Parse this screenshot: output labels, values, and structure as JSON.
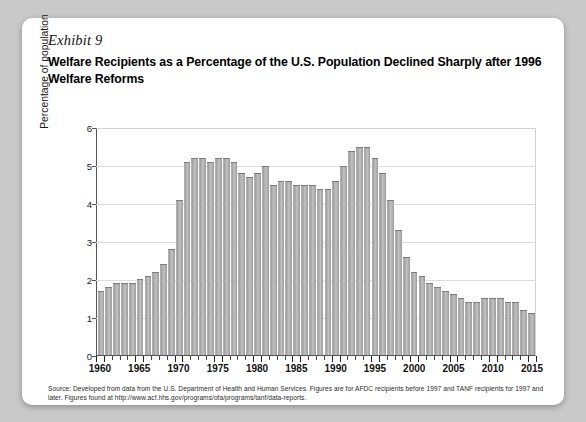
{
  "exhibit": {
    "label": "Exhibit 9"
  },
  "title": "Welfare Recipients as a Percentage of the U.S. Population Declined Sharply after 1996 Welfare Reforms",
  "source_note": "Source: Developed from data from the U.S. Department of Health and Human Services. Figures are for AFDC recipients before 1997 and TANF recipients for 1997 and later. Figures found at http://www.acf.hhs.gov/programs/ofa/programs/tanf/data-reports.",
  "colors": {
    "bar_fill": "#b0b0b0",
    "bar_edge": "#7d7d7d",
    "gridline": "#dcdcdc",
    "axis": "#555555",
    "card_background": "#ffffff",
    "page_background": "#c9c9c9"
  },
  "chart_data": {
    "type": "bar",
    "title": "Welfare Recipients as a Percentage of the U.S. Population Declined Sharply after 1996 Welfare Reforms",
    "xlabel": "",
    "ylabel": "Percentage of population",
    "ylim": [
      0,
      6
    ],
    "yticks": [
      0,
      1,
      2,
      3,
      4,
      5,
      6
    ],
    "ytick_labels": [
      "0",
      "1",
      "2",
      "3",
      "4",
      "5",
      "6"
    ],
    "xtick_labels": [
      "1960",
      "1965",
      "1970",
      "1975",
      "1980",
      "1985",
      "1990",
      "1995",
      "2000",
      "2005",
      "2010",
      "2015"
    ],
    "grid": true,
    "legend": null,
    "categories": [
      "1960",
      "1961",
      "1962",
      "1963",
      "1964",
      "1965",
      "1966",
      "1967",
      "1968",
      "1969",
      "1970",
      "1971",
      "1972",
      "1973",
      "1974",
      "1975",
      "1976",
      "1977",
      "1978",
      "1979",
      "1980",
      "1981",
      "1982",
      "1983",
      "1984",
      "1985",
      "1986",
      "1987",
      "1988",
      "1989",
      "1990",
      "1991",
      "1992",
      "1993",
      "1994",
      "1995",
      "1996",
      "1997",
      "1998",
      "1999",
      "2000",
      "2001",
      "2002",
      "2003",
      "2004",
      "2005",
      "2006",
      "2007",
      "2008",
      "2009",
      "2010",
      "2011",
      "2012",
      "2013",
      "2014",
      "2015"
    ],
    "values": [
      1.7,
      1.8,
      1.9,
      1.9,
      1.9,
      2.0,
      2.1,
      2.2,
      2.4,
      2.8,
      4.1,
      5.1,
      5.2,
      5.2,
      5.1,
      5.2,
      5.2,
      5.1,
      4.8,
      4.7,
      4.8,
      5.0,
      4.5,
      4.6,
      4.6,
      4.5,
      4.5,
      4.5,
      4.4,
      4.4,
      4.6,
      5.0,
      5.4,
      5.5,
      5.5,
      5.2,
      4.8,
      4.1,
      3.3,
      2.6,
      2.2,
      2.1,
      1.9,
      1.8,
      1.7,
      1.6,
      1.5,
      1.4,
      1.4,
      1.5,
      1.5,
      1.5,
      1.4,
      1.4,
      1.2,
      1.1
    ]
  }
}
